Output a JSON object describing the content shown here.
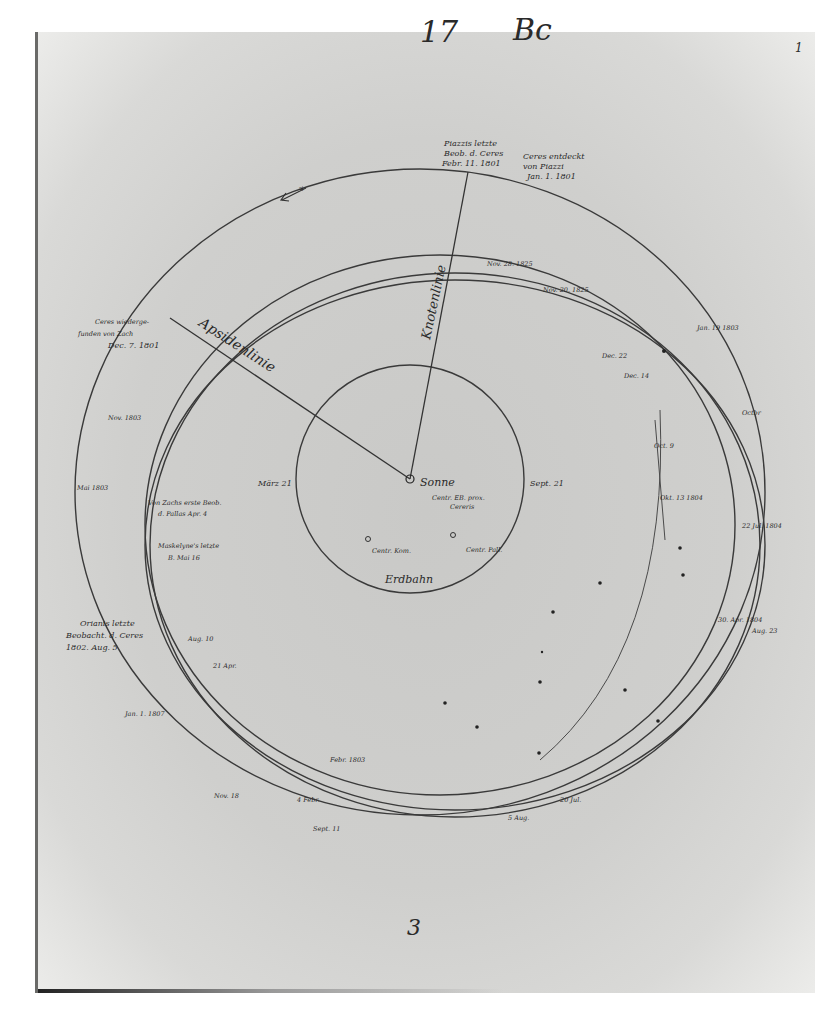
{
  "page": {
    "header_number": "17",
    "header_letters": "Bc",
    "corner_number": "1",
    "footer_number": "3"
  },
  "diagram": {
    "center_label": "Sonne",
    "center_note": [
      "Centr. EB. prox.",
      "Cereris"
    ],
    "earth_orbit_label": "Erdbahn",
    "earth_markers": {
      "left": "März 21",
      "right": "Sept. 21"
    },
    "centers": {
      "kom": "Centr. Kom.",
      "pall": "Centr. Pall."
    },
    "lines": {
      "apsidenlinie": "Apsidenlinie",
      "knotenlinie": "Knotenlinie"
    },
    "annotations": {
      "piazzi_last": [
        "Piazzis letzte",
        "Beob. d. Ceres",
        "Febr. 11. 1801"
      ],
      "ceres_discovered": [
        "Ceres entdeckt",
        "von Piazzi",
        "Jan. 1. 1801"
      ],
      "ceres_refound": [
        "Ceres wiederge-",
        "funden von Zach",
        "Dec. 7. 1801"
      ],
      "zach_pallas": [
        "Von Zachs erste Beob.",
        "d. Pallas Apr. 4"
      ],
      "maskelyne": [
        "Maskelyne's letzte",
        "B. Mai 16"
      ],
      "orianis": [
        "Orianis letzte",
        "Beobacht. d. Ceres",
        "1802. Aug. 5"
      ]
    },
    "date_marks": [
      "Nov. 28. 1825",
      "Nov. 20. 1825",
      "Jan. 19 1803",
      "Dec. 22",
      "Dec. 14",
      "Oct. 9",
      "Okt. 13 1804",
      "Octbr",
      "22 Jul. 1804",
      "30. Apr. 1804",
      "Aug. 23",
      "Nov. 1803",
      "Mai 1803",
      "Aug. 10",
      "21 Apr.",
      "Jan. 1. 1807",
      "Febr. 1803",
      "4 Febr.",
      "Nov. 18",
      "Sept. 11",
      "5 Aug.",
      "20 Jul."
    ],
    "legend_arrow": "direction"
  }
}
